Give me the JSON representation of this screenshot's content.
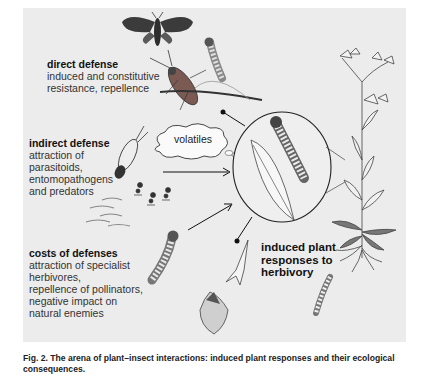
{
  "figure": {
    "background_color": "#ececec",
    "labels": {
      "direct_defense": {
        "title": "direct defense",
        "body": "induced and constitutive\nresistance, repellence"
      },
      "indirect_defense": {
        "title": "indirect defense",
        "body": "attraction of\nparasitoids,\nentomopathogens\nand predators"
      },
      "costs_of_defenses": {
        "title": "costs of defenses",
        "body": "attraction of specialist\nherbivores,\nrepellence of pollinators,\nnegative impact on\nnatural enemies"
      },
      "induced_responses": {
        "title": "induced plant\nresponses to\nherbivory"
      },
      "volatiles": "volatiles"
    },
    "illustrations": [
      "moth",
      "bug",
      "caterpillar-on-twig",
      "parasitoid-wasp",
      "ants",
      "nematodes",
      "caterpillar",
      "damaged-flower",
      "plant-with-roots",
      "larva-in-soil",
      "magnified-caterpillar-on-leaf"
    ]
  },
  "caption": {
    "text": "Fig. 2.  The arena of plant–insect interactions: induced plant responses and their ecological consequences."
  }
}
